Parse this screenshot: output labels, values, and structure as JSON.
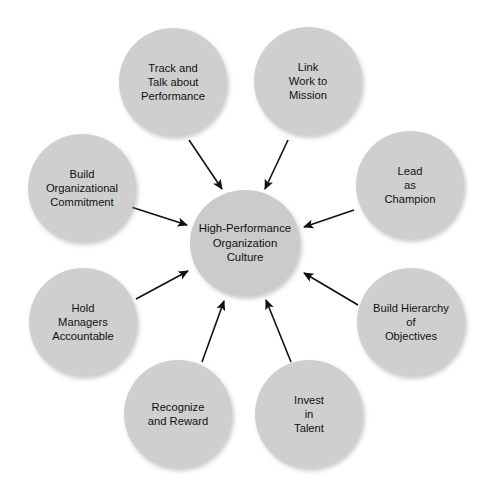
{
  "diagram": {
    "type": "hub-and-spoke",
    "background_color": "#ffffff",
    "node_fill_color": "#cfcfcf",
    "center_fill_color": "#cbcbcb",
    "arrow_color": "#111111",
    "text_color": "#111111",
    "arrow_direction": "outer-nodes-point-to-center",
    "center": {
      "label": "High-Performance\nOrganization\nCulture",
      "x": 190,
      "y": 190,
      "width": 110,
      "height": 106
    },
    "nodes": [
      {
        "id": "track-and-talk-about-performance",
        "label": "Track and\nTalk about\nPerformance",
        "x": 119,
        "y": 28,
        "position": "top-left"
      },
      {
        "id": "link-work-to-mission",
        "label": "Link\nWork to\nMission",
        "x": 254,
        "y": 27,
        "position": "top-right"
      },
      {
        "id": "lead-as-champion",
        "label": "Lead\nas\nChampion",
        "x": 356,
        "y": 131,
        "position": "right-upper"
      },
      {
        "id": "build-hierarchy-of-objectives",
        "label": "Build Hierarchy\nof\nObjectives",
        "x": 357,
        "y": 268,
        "position": "right-lower"
      },
      {
        "id": "invest-in-talent",
        "label": "Invest\nin\nTalent",
        "x": 255,
        "y": 360,
        "position": "bottom-right"
      },
      {
        "id": "recognize-and-reward",
        "label": "Recognize\nand Reward",
        "x": 124,
        "y": 360,
        "position": "bottom-left"
      },
      {
        "id": "hold-managers-accountable",
        "label": "Hold\nManagers\nAccountable",
        "x": 29,
        "y": 268,
        "position": "left-lower"
      },
      {
        "id": "build-organizational-commitment",
        "label": "Build\nOrganizational\nCommitment",
        "x": 28,
        "y": 134,
        "position": "left-upper"
      }
    ],
    "arrows": [
      {
        "from": "track-and-talk-about-performance",
        "to": "center",
        "x1": 189,
        "y1": 140,
        "x2": 222,
        "y2": 189
      },
      {
        "from": "link-work-to-mission",
        "to": "center",
        "x1": 288,
        "y1": 140,
        "x2": 265,
        "y2": 189
      },
      {
        "from": "lead-as-champion",
        "to": "center",
        "x1": 354,
        "y1": 210,
        "x2": 304,
        "y2": 227
      },
      {
        "from": "build-hierarchy-of-objectives",
        "to": "center",
        "x1": 358,
        "y1": 305,
        "x2": 304,
        "y2": 273
      },
      {
        "from": "invest-in-talent",
        "to": "center",
        "x1": 291,
        "y1": 362,
        "x2": 266,
        "y2": 300
      },
      {
        "from": "recognize-and-reward",
        "to": "center",
        "x1": 202,
        "y1": 362,
        "x2": 224,
        "y2": 301
      },
      {
        "from": "hold-managers-accountable",
        "to": "center",
        "x1": 136,
        "y1": 299,
        "x2": 188,
        "y2": 271
      },
      {
        "from": "build-organizational-commitment",
        "to": "center",
        "x1": 128,
        "y1": 206,
        "x2": 187,
        "y2": 225
      }
    ]
  }
}
